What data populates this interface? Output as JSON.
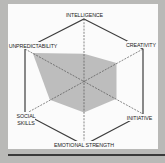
{
  "chart_data": {
    "type": "radar",
    "title": "",
    "categories": [
      "INTELLIGENCE",
      "CREATIVITY",
      "INITIATIVE",
      "EMOTIONAL STRENGTH",
      "SOCIAL SKILLS",
      "UNPREDICTABILITY"
    ],
    "series": [
      {
        "name": "profile",
        "values": [
          0.43,
          0.55,
          0.55,
          0.5,
          0.58,
          0.87
        ],
        "color": "#bdbdbd"
      }
    ],
    "rlim": [
      0,
      1
    ],
    "grid": "spokes dashed",
    "legend": "none"
  },
  "labels": {
    "intelligence": "INTELLIGENCE",
    "creativity": "CREATIVITY",
    "initiative": "INITIATIVE",
    "emotional_strength": "EMOTIONAL STRENGTH",
    "social_line1": "SOCIAL",
    "social_line2": "SKILLS",
    "unpredictability": "UNPREDICTABILITY"
  },
  "colors": {
    "frame": "#b9b9b7",
    "panel": "#fbfbfb",
    "fill": "#bdbdbd",
    "line": "#444444"
  }
}
